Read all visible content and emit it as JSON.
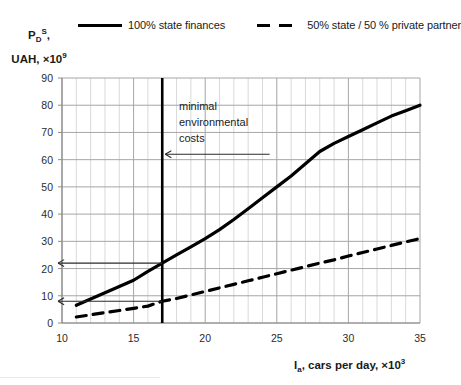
{
  "legend": {
    "position": "top",
    "entries": [
      {
        "label": "100% state finances",
        "style": "solid",
        "color": "#000000"
      },
      {
        "label": "50% state / 50 % private partner",
        "style": "dashed",
        "color": "#000000"
      }
    ]
  },
  "axes": {
    "y_title_main": "P",
    "y_title_sub": "D",
    "y_title_sup": "S",
    "y_title_comma": ",",
    "y_title_line2_main": "UAH, ×10",
    "y_title_line2_sup": "9",
    "x_title_main": "I",
    "x_title_sub": "a",
    "x_title_rest": ", cars per day, ×10",
    "x_title_sup": "3"
  },
  "annotation": {
    "line1": "minimal",
    "line2": "environmental",
    "line3": "costs"
  },
  "chart_data": {
    "type": "line",
    "title": "",
    "subtitle": "",
    "xlabel": "I_a, cars per day, ×10^3",
    "ylabel": "P_D^S, UAH, ×10^9",
    "xlim": [
      10,
      35
    ],
    "ylim": [
      0,
      90
    ],
    "xticks": [
      10,
      15,
      20,
      25,
      30,
      35
    ],
    "yticks": [
      0,
      10,
      20,
      30,
      40,
      50,
      60,
      70,
      80,
      90
    ],
    "x_minor_step": 1,
    "y_minor_step": 10,
    "grid": true,
    "legend_position": "top",
    "series": [
      {
        "name": "100% state finances",
        "style": "solid",
        "color": "#000000",
        "x": [
          11,
          12,
          13,
          14,
          15,
          16,
          17,
          18,
          19,
          20,
          21,
          22,
          23,
          24,
          25,
          26,
          27,
          28,
          29,
          30,
          31,
          32,
          33,
          34,
          35
        ],
        "values": [
          6.5,
          8.8,
          11.1,
          13.4,
          15.7,
          19.0,
          22.0,
          25.0,
          28.0,
          31.0,
          34.3,
          38.0,
          42.0,
          46.0,
          50.0,
          54.0,
          58.5,
          63.0,
          66.0,
          68.5,
          71.0,
          73.5,
          76.0,
          78.0,
          80.0
        ]
      },
      {
        "name": "50% state / 50 % private partner",
        "style": "dashed",
        "color": "#000000",
        "x": [
          11,
          12,
          13,
          14,
          15,
          16,
          17,
          18,
          19,
          20,
          21,
          22,
          23,
          24,
          25,
          26,
          27,
          28,
          29,
          30,
          31,
          32,
          33,
          34,
          35
        ],
        "values": [
          2.2,
          3.0,
          3.8,
          4.6,
          5.4,
          6.2,
          8.0,
          9.0,
          10.3,
          11.6,
          12.9,
          14.2,
          15.5,
          16.8,
          18.1,
          19.4,
          20.7,
          22.0,
          23.2,
          24.6,
          25.9,
          27.2,
          28.5,
          29.8,
          31.0
        ]
      }
    ],
    "annotations": [
      {
        "name": "minimal-environmental-costs",
        "text": "minimal environmental costs",
        "vertical_line_x": 17,
        "arrow_to_x": 17,
        "arrow_to_y": 62,
        "arrow_from_x": 24.5
      },
      {
        "name": "solid-intercept-arrow",
        "from_x": 17,
        "to_x": 10,
        "y": 22
      },
      {
        "name": "dashed-intercept-arrow",
        "from_x": 17,
        "to_x": 10,
        "y": 8
      }
    ]
  }
}
